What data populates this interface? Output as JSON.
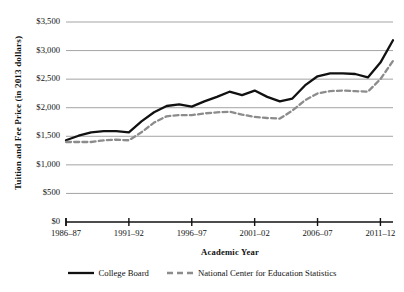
{
  "chart_data": {
    "type": "line",
    "title": "",
    "xlabel": "Academic Year",
    "ylabel": "Tuition and Fee Price (in 2013 dollars)",
    "grid": true,
    "legend_position": "bottom",
    "xlim": [
      1986,
      2012
    ],
    "ylim": [
      0,
      3500
    ],
    "y_ticks": [
      0,
      500,
      1000,
      1500,
      2000,
      2500,
      3000,
      3500
    ],
    "y_tick_labels": [
      "$0",
      "$500",
      "$1,000",
      "$1,500",
      "$2,000",
      "$2,500",
      "$3,000",
      "$3,500"
    ],
    "x_ticks": [
      1986,
      1991,
      1996,
      2001,
      2006,
      2011
    ],
    "x_tick_labels": [
      "1986–87",
      "1991–92",
      "1996–97",
      "2001–02",
      "2006–07",
      "2011–12"
    ],
    "x": [
      1986,
      1987,
      1988,
      1989,
      1990,
      1991,
      1992,
      1993,
      1994,
      1995,
      1996,
      1997,
      1998,
      1999,
      2000,
      2001,
      2002,
      2003,
      2004,
      2005,
      2006,
      2007,
      2008,
      2009,
      2010,
      2011,
      2012
    ],
    "x_categories": [
      "1986–87",
      "1987–88",
      "1988–89",
      "1989–90",
      "1990–91",
      "1991–92",
      "1992–93",
      "1993–94",
      "1994–95",
      "1995–96",
      "1996–97",
      "1997–98",
      "1998–99",
      "1999–2000",
      "2000–01",
      "2001–02",
      "2002–03",
      "2003–04",
      "2004–05",
      "2005–06",
      "2006–07",
      "2007–08",
      "2008–09",
      "2009–10",
      "2010–11",
      "2011–12",
      "2012–13"
    ],
    "series": [
      {
        "name": "College Board",
        "style": "solid",
        "color": "#111111",
        "width": 2.3,
        "values": [
          1430,
          1510,
          1570,
          1590,
          1590,
          1570,
          1760,
          1920,
          2030,
          2060,
          2020,
          2110,
          2190,
          2280,
          2220,
          2300,
          2190,
          2110,
          2160,
          2390,
          2550,
          2600,
          2600,
          2590,
          2530,
          2790,
          3180
        ]
      },
      {
        "name": "National Center for Education Statistics",
        "style": "dashed",
        "color": "#8c8c8c",
        "width": 2.3,
        "values": [
          1400,
          1400,
          1400,
          1430,
          1440,
          1430,
          1570,
          1740,
          1850,
          1870,
          1870,
          1900,
          1920,
          1930,
          1880,
          1840,
          1820,
          1810,
          1950,
          2130,
          2250,
          2290,
          2300,
          2290,
          2280,
          2500,
          2820
        ]
      }
    ]
  },
  "legend": {
    "entries": [
      {
        "label": "College Board",
        "swatch": "solid-line-swatch"
      },
      {
        "label": "National Center for Education Statistics",
        "swatch": "dashed-line-swatch"
      }
    ]
  },
  "colors": {
    "series_primary": "#111111",
    "series_secondary": "#8c8c8c",
    "gridline": "#9a9a9a",
    "axis": "#111111",
    "background": "#ffffff"
  }
}
